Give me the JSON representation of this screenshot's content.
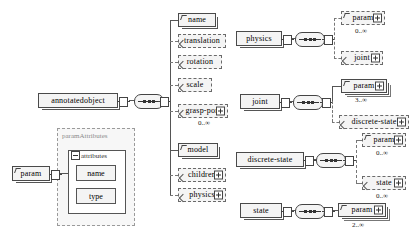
{
  "diagram": {
    "type": "xsd-tree",
    "colors": {
      "node_fill": "#f4f4f4",
      "node_border": "#4a4a4a",
      "optional_border": "#6a6a6a",
      "group_border": "#9a9a9a",
      "group_label": "#8a8a8a",
      "background": "#ffffff"
    }
  },
  "roots": {
    "annotatedobject": {
      "label": "annotatedobject"
    },
    "physics": {
      "label": "physics"
    },
    "joint": {
      "label": "joint"
    },
    "discrete_state": {
      "label": "discrete-state"
    },
    "state": {
      "label": "state"
    },
    "param": {
      "label": "param"
    }
  },
  "annotatedobject_children": [
    {
      "label": "name",
      "style": "solid",
      "expand": false,
      "cardinality": ""
    },
    {
      "label": "translation",
      "style": "dashed",
      "expand": false,
      "cardinality": ""
    },
    {
      "label": "rotation",
      "style": "dashed",
      "expand": false,
      "cardinality": ""
    },
    {
      "label": "scale",
      "style": "dashed",
      "expand": false,
      "cardinality": ""
    },
    {
      "label": "grasp-port",
      "style": "dashed",
      "expand": true,
      "cardinality": "0..∞"
    },
    {
      "label": "model",
      "style": "solid",
      "expand": false,
      "cardinality": ""
    },
    {
      "label": "children",
      "style": "dashed",
      "expand": true,
      "cardinality": ""
    },
    {
      "label": "physics",
      "style": "dashed",
      "expand": true,
      "cardinality": ""
    }
  ],
  "physics_children": [
    {
      "label": "param",
      "style": "dashed",
      "expand": true,
      "cardinality": "0..∞"
    },
    {
      "label": "joint",
      "style": "dashed",
      "expand": true,
      "cardinality": ""
    }
  ],
  "joint_children": [
    {
      "label": "param",
      "style": "solid",
      "expand": true,
      "cardinality": "3..∞"
    },
    {
      "label": "discrete-state",
      "style": "dashed",
      "expand": true,
      "cardinality": ""
    }
  ],
  "discrete_state_children": [
    {
      "label": "param",
      "style": "dashed",
      "expand": true,
      "cardinality": "0..∞"
    },
    {
      "label": "state",
      "style": "dashed",
      "expand": true,
      "cardinality": "0..∞"
    }
  ],
  "state_children": [
    {
      "label": "param",
      "style": "solid",
      "expand": true,
      "cardinality": "2..∞"
    }
  ],
  "param_attributes_group": {
    "group_label": "paramAttributes",
    "attributes_label": "attributes",
    "attributes": [
      {
        "label": "name"
      },
      {
        "label": "type"
      }
    ]
  }
}
